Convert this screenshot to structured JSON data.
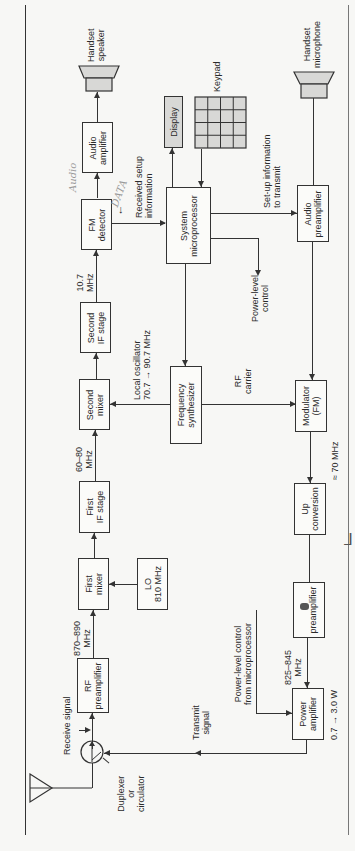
{
  "figure": {
    "orientation": "rotated 90 degrees counter-clockwise"
  },
  "receive_chain": {
    "handset_speaker": "Handset\nspeaker",
    "audio_amplifier": "Audio\namplifier",
    "fm_detector": "FM\ndetector",
    "second_if_stage": "Second\nIF stage",
    "second_mixer": "Second\nmixer",
    "first_if_stage": "First\nIF stage",
    "first_mixer": "First\nmixer",
    "rf_preamplifier": "RF\npreamplifier",
    "lo": "LO\n810 MHz",
    "freq_10_7": "10.7\nMHz",
    "freq_60_80": "60–80\nMHz",
    "freq_870_890": "870–890\nMHz",
    "receive_signal": "Receive signal"
  },
  "control": {
    "display": "Display",
    "keypad": "Keypad",
    "system_microprocessor": "System\nmicroprocessor",
    "frequency_synthesizer": "Frequency\nsynthesizer",
    "received_setup": "Received setup\ninformation",
    "setup_to_transmit": "Set-up information\nto transmit",
    "power_level_control": "Power-level\ncontrol",
    "local_oscillator": "Local oscillator\n70.7 → 90.7 MHz",
    "rf_carrier": "RF\ncarrier"
  },
  "transmit_chain": {
    "handset_microphone": "Handset\nmicrophone",
    "audio_preamplifier": "Audio\npreamplifier",
    "modulator": "Modulator\n(FM)",
    "up_conversion": "Up\nconversion",
    "preamplifier": "preamplifier",
    "power_amplifier": "Power\namplifier",
    "freq_70": "≈ 70 MHz",
    "freq_825_845": "825–845\nMHz",
    "power_out": "0.7 → 3.0 W",
    "power_control_from_micro": "Power-level control\nfrom microprocessor",
    "transmit_signal": "Transmit\nsignal"
  },
  "antenna": {
    "duplexer": "Duplexer\nor\ncirculator"
  },
  "handwritten": {
    "audio": "Audio",
    "data": "DATA"
  },
  "colors": {
    "line": "#333333",
    "background": "#f7f7f5",
    "gray_fill": "#d8d8d6",
    "handwriting": "#9a9a9a"
  }
}
